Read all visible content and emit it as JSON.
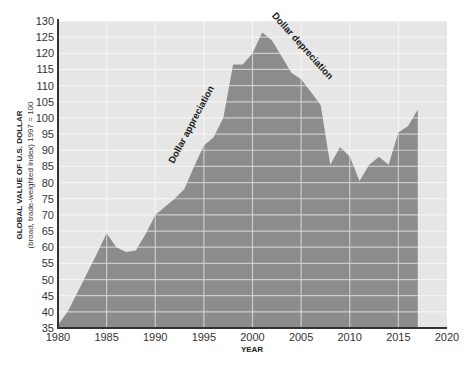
{
  "chart_data": {
    "type": "area",
    "title": "",
    "xlabel": "YEAR",
    "ylabel": "GLOBAL VALUE OF U.S. DOLLAR",
    "ylabel_sub": "(broad, trade-weighted index) 1997 = 100",
    "xlim": [
      1980,
      2020
    ],
    "ylim": [
      35,
      130
    ],
    "x_ticks": [
      1980,
      1985,
      1990,
      1995,
      2000,
      2005,
      2010,
      2015,
      2020
    ],
    "y_ticks": [
      35,
      40,
      45,
      50,
      55,
      60,
      65,
      70,
      75,
      80,
      85,
      90,
      95,
      100,
      105,
      110,
      115,
      120,
      125,
      130
    ],
    "grid": true,
    "legend": null,
    "annotations": [
      {
        "text": "Dollar appreciation",
        "x": 1994.5,
        "y": 100
      },
      {
        "text": "Dollar depreciation",
        "x": 2004.5,
        "y": 121
      }
    ],
    "x": [
      1980,
      1981,
      1982,
      1983,
      1984,
      1985,
      1986,
      1987,
      1988,
      1989,
      1990,
      1991,
      1992,
      1993,
      1994,
      1995,
      1996,
      1997,
      1998,
      1999,
      2000,
      2001,
      2002,
      2003,
      2004,
      2005,
      2006,
      2007,
      2008,
      2009,
      2010,
      2011,
      2012,
      2013,
      2014,
      2015,
      2016,
      2017
    ],
    "values": [
      36,
      40,
      46,
      52,
      58,
      64.3,
      60,
      58.5,
      59,
      64,
      70,
      72.5,
      75,
      78,
      85,
      91.5,
      94,
      100,
      116.5,
      116.5,
      120,
      126.4,
      124,
      119,
      114,
      112,
      108,
      104,
      85.5,
      91,
      88,
      80.5,
      85.5,
      88,
      85.5,
      95.5,
      97.5,
      102.6
    ],
    "colors": {
      "area": "#8c8c8c",
      "plot_bg": "#e6e6e6",
      "grid": "#f7f7f7",
      "axis": "#333333"
    }
  }
}
